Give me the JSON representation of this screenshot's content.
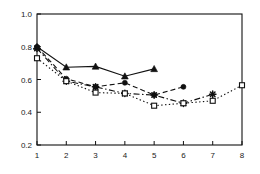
{
  "chart_data": {
    "type": "line",
    "title": "",
    "subtitle": "",
    "xlabel": "",
    "ylabel": "",
    "xlim": [
      1,
      8
    ],
    "ylim": [
      0.2,
      1.0
    ],
    "grid": false,
    "legend": "none",
    "x_ticks": [
      "1",
      "2",
      "3",
      "4",
      "5",
      "6",
      "7",
      "8"
    ],
    "x_tick_values": [
      1,
      2,
      3,
      4,
      5,
      6,
      7,
      8
    ],
    "y_ticks": [
      "0.2",
      "0.4",
      "0.6",
      "0.8",
      "1.0"
    ],
    "y_tick_values": [
      0.2,
      0.4,
      0.6,
      0.8,
      1.0
    ],
    "series": [
      {
        "name": "series-1",
        "marker": "filled-triangle",
        "linestyle": "solid",
        "color": "#111111",
        "x": [
          1,
          2,
          3,
          4,
          5
        ],
        "values": [
          0.8,
          0.675,
          0.68,
          0.62,
          0.665
        ]
      },
      {
        "name": "series-2",
        "marker": "filled-circle",
        "linestyle": "dashed",
        "color": "#111111",
        "x": [
          1,
          2,
          3,
          4,
          5,
          6
        ],
        "values": [
          0.8,
          0.605,
          0.555,
          0.58,
          0.505,
          0.555
        ]
      },
      {
        "name": "series-3",
        "marker": "star",
        "linestyle": "dash-dot",
        "color": "#111111",
        "x": [
          1,
          2,
          3,
          4,
          5,
          6,
          7
        ],
        "values": [
          0.79,
          0.59,
          0.555,
          0.515,
          0.505,
          0.455,
          0.51
        ]
      },
      {
        "name": "series-4",
        "marker": "open-square",
        "linestyle": "dotted",
        "color": "#111111",
        "x": [
          1,
          2,
          3,
          4,
          5,
          6,
          7,
          8
        ],
        "values": [
          0.73,
          0.59,
          0.52,
          0.515,
          0.44,
          0.455,
          0.47,
          0.565
        ]
      }
    ]
  },
  "axes": {
    "frame_color": "#111111",
    "background": "#ffffff"
  }
}
